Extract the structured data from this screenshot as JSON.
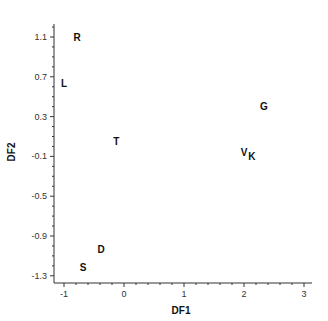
{
  "chart_data": {
    "type": "scatter",
    "title": "",
    "xlabel": "DF1",
    "ylabel": "DF2",
    "xlim": [
      -1.15,
      3.15
    ],
    "ylim": [
      -1.4,
      1.23
    ],
    "x_ticks": [
      -1,
      0,
      1,
      2,
      3
    ],
    "x_tick_labels": [
      "-1",
      "0",
      "1",
      "2",
      "3"
    ],
    "y_ticks": [
      1.1,
      0.7,
      0.3,
      -0.1,
      -0.5,
      -0.9,
      -1.3
    ],
    "y_tick_labels": [
      "1.1",
      "0.7",
      "0.3",
      "-0.1",
      "-0.5",
      "-0.9",
      "-1.3"
    ],
    "grid": false,
    "legend": null,
    "marker": "text-label",
    "points": [
      {
        "label": "R",
        "x": -0.78,
        "y": 1.1
      },
      {
        "label": "L",
        "x": -1.0,
        "y": 0.64
      },
      {
        "label": "G",
        "x": 2.33,
        "y": 0.41
      },
      {
        "label": "T",
        "x": -0.13,
        "y": 0.05
      },
      {
        "label": "V",
        "x": 2.0,
        "y": -0.06
      },
      {
        "label": "K",
        "x": 2.13,
        "y": -0.1
      },
      {
        "label": "D",
        "x": -0.38,
        "y": -1.03
      },
      {
        "label": "S",
        "x": -0.68,
        "y": -1.21
      }
    ]
  },
  "layout": {
    "x_origin_px": 124,
    "x_px_per_unit": 60,
    "y_ref_value": 1.1,
    "y_ref_px": 37,
    "y_px_per_unit": 99.5,
    "axis_left_px": 54,
    "axis_right_px": 312,
    "axis_top_px": 24,
    "axis_bottom_px": 283
  }
}
